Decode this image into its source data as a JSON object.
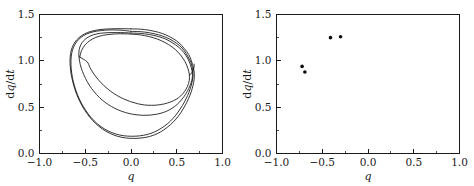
{
  "figure": {
    "background_color": "#ffffff",
    "line_color": "#101010",
    "marker_color": "#0d0d0d",
    "panels": [
      {
        "id": "left",
        "name": "phase-portrait"
      },
      {
        "id": "right",
        "name": "poincare-section"
      }
    ]
  },
  "chart_data": [
    {
      "type": "line",
      "panel": "left",
      "name": "phase-portrait",
      "title": "",
      "xlabel": "q",
      "ylabel": "dq/dt",
      "xlim": [
        -1.0,
        1.0
      ],
      "ylim": [
        0.0,
        1.5
      ],
      "xticks": [
        -1.0,
        -0.5,
        0.0,
        0.5,
        1.0
      ],
      "xtick_labels": [
        "-1.0",
        "-0.5",
        "0.0",
        "0.5",
        "1.0"
      ],
      "yticks": [
        0.0,
        0.5,
        1.0,
        1.5
      ],
      "ytick_labels": [
        "0.0",
        "0.5",
        "1.0",
        "1.5"
      ],
      "x_minor_ticks": [
        -0.75,
        -0.25,
        0.25,
        0.75
      ],
      "y_minor_ticks": [
        0.25,
        0.75,
        1.25
      ],
      "grid": false,
      "legend": null,
      "series": [
        {
          "name": "outer-orbit",
          "comment": "outermost closed loop of the chaotic attractor",
          "points": [
            [
              0.0,
              1.345
            ],
            [
              0.1,
              1.342
            ],
            [
              0.2,
              1.33
            ],
            [
              0.3,
              1.308
            ],
            [
              0.38,
              1.28
            ],
            [
              0.46,
              1.24
            ],
            [
              0.53,
              1.19
            ],
            [
              0.58,
              1.135
            ],
            [
              0.63,
              1.07
            ],
            [
              0.66,
              1.0
            ],
            [
              0.682,
              0.925
            ],
            [
              0.692,
              0.86
            ],
            [
              0.69,
              0.8
            ],
            [
              0.678,
              0.735
            ],
            [
              0.658,
              0.665
            ],
            [
              0.628,
              0.59
            ],
            [
              0.59,
              0.515
            ],
            [
              0.545,
              0.44
            ],
            [
              0.492,
              0.372
            ],
            [
              0.43,
              0.31
            ],
            [
              0.36,
              0.256
            ],
            [
              0.285,
              0.213
            ],
            [
              0.205,
              0.184
            ],
            [
              0.12,
              0.168
            ],
            [
              0.03,
              0.163
            ],
            [
              -0.06,
              0.168
            ],
            [
              -0.148,
              0.186
            ],
            [
              -0.232,
              0.218
            ],
            [
              -0.312,
              0.264
            ],
            [
              -0.386,
              0.323
            ],
            [
              -0.452,
              0.394
            ],
            [
              -0.51,
              0.474
            ],
            [
              -0.56,
              0.562
            ],
            [
              -0.6,
              0.655
            ],
            [
              -0.63,
              0.75
            ],
            [
              -0.652,
              0.845
            ],
            [
              -0.664,
              0.938
            ],
            [
              -0.666,
              1.025
            ],
            [
              -0.655,
              1.105
            ],
            [
              -0.63,
              1.172
            ],
            [
              -0.592,
              1.228
            ],
            [
              -0.54,
              1.272
            ],
            [
              -0.476,
              1.305
            ],
            [
              -0.4,
              1.327
            ],
            [
              -0.316,
              1.34
            ],
            [
              -0.222,
              1.345
            ],
            [
              -0.12,
              1.347
            ],
            [
              0.0,
              1.345
            ]
          ]
        },
        {
          "name": "second-outer-orbit",
          "comment": "loop slightly inside the outer band",
          "points": [
            [
              0.0,
              1.318
            ],
            [
              0.1,
              1.315
            ],
            [
              0.2,
              1.303
            ],
            [
              0.3,
              1.281
            ],
            [
              0.38,
              1.254
            ],
            [
              0.46,
              1.214
            ],
            [
              0.53,
              1.165
            ],
            [
              0.58,
              1.112
            ],
            [
              0.62,
              1.05
            ],
            [
              0.655,
              0.982
            ],
            [
              0.672,
              0.912
            ],
            [
              0.678,
              0.852
            ],
            [
              0.672,
              0.793
            ],
            [
              0.657,
              0.73
            ],
            [
              0.634,
              0.662
            ],
            [
              0.602,
              0.59
            ],
            [
              0.562,
              0.518
            ],
            [
              0.515,
              0.447
            ],
            [
              0.462,
              0.382
            ],
            [
              0.4,
              0.322
            ],
            [
              0.33,
              0.272
            ],
            [
              0.256,
              0.232
            ],
            [
              0.176,
              0.205
            ],
            [
              0.092,
              0.19
            ],
            [
              0.005,
              0.186
            ],
            [
              -0.082,
              0.192
            ],
            [
              -0.168,
              0.211
            ],
            [
              -0.25,
              0.243
            ],
            [
              -0.328,
              0.29
            ],
            [
              -0.4,
              0.35
            ],
            [
              -0.463,
              0.421
            ],
            [
              -0.518,
              0.501
            ],
            [
              -0.565,
              0.588
            ],
            [
              -0.602,
              0.68
            ],
            [
              -0.63,
              0.774
            ],
            [
              -0.648,
              0.868
            ],
            [
              -0.656,
              0.958
            ],
            [
              -0.654,
              1.04
            ],
            [
              -0.64,
              1.115
            ],
            [
              -0.612,
              1.178
            ],
            [
              -0.572,
              1.231
            ],
            [
              -0.518,
              1.272
            ],
            [
              -0.452,
              1.302
            ],
            [
              -0.376,
              1.32
            ],
            [
              -0.292,
              1.33
            ],
            [
              -0.198,
              1.334
            ],
            [
              -0.098,
              1.33
            ],
            [
              0.0,
              1.318
            ]
          ]
        },
        {
          "name": "inner-orbit-a",
          "comment": "inner loop that terminates near the right-hand cusp",
          "points": [
            [
              0.0,
              1.3
            ],
            [
              0.1,
              1.296
            ],
            [
              0.2,
              1.284
            ],
            [
              0.3,
              1.262
            ],
            [
              0.38,
              1.234
            ],
            [
              0.45,
              1.196
            ],
            [
              0.52,
              1.148
            ],
            [
              0.575,
              1.092
            ],
            [
              0.618,
              1.03
            ],
            [
              0.648,
              0.962
            ],
            [
              0.666,
              0.895
            ],
            [
              0.672,
              0.84
            ],
            [
              0.664,
              0.788
            ],
            [
              0.645,
              0.732
            ],
            [
              0.616,
              0.672
            ],
            [
              0.578,
              0.612
            ],
            [
              0.532,
              0.556
            ],
            [
              0.478,
              0.508
            ],
            [
              0.418,
              0.47
            ],
            [
              0.352,
              0.442
            ],
            [
              0.282,
              0.424
            ],
            [
              0.208,
              0.414
            ],
            [
              0.132,
              0.412
            ],
            [
              0.055,
              0.418
            ],
            [
              -0.022,
              0.432
            ],
            [
              -0.1,
              0.455
            ],
            [
              -0.176,
              0.487
            ],
            [
              -0.248,
              0.528
            ],
            [
              -0.316,
              0.578
            ],
            [
              -0.378,
              0.637
            ],
            [
              -0.432,
              0.703
            ],
            [
              -0.478,
              0.774
            ],
            [
              -0.515,
              0.848
            ],
            [
              -0.544,
              0.922
            ],
            [
              -0.562,
              0.996
            ],
            [
              -0.57,
              1.062
            ],
            [
              -0.566,
              1.122
            ],
            [
              -0.548,
              1.175
            ],
            [
              -0.515,
              1.22
            ],
            [
              -0.468,
              1.256
            ],
            [
              -0.408,
              1.282
            ],
            [
              -0.336,
              1.297
            ],
            [
              -0.252,
              1.304
            ],
            [
              -0.16,
              1.305
            ],
            [
              -0.07,
              1.304
            ],
            [
              0.0,
              1.3
            ]
          ]
        },
        {
          "name": "inner-orbit-b",
          "comment": "innermost loop of the lower band",
          "points": [
            [
              -0.56,
              1.04
            ],
            [
              -0.54,
              1.112
            ],
            [
              -0.502,
              1.172
            ],
            [
              -0.45,
              1.218
            ],
            [
              -0.386,
              1.252
            ],
            [
              -0.312,
              1.274
            ],
            [
              -0.228,
              1.286
            ],
            [
              -0.136,
              1.292
            ],
            [
              -0.04,
              1.291
            ],
            [
              0.056,
              1.285
            ],
            [
              0.15,
              1.272
            ],
            [
              0.242,
              1.25
            ],
            [
              0.33,
              1.218
            ],
            [
              0.41,
              1.176
            ],
            [
              0.482,
              1.124
            ],
            [
              0.542,
              1.062
            ],
            [
              0.59,
              0.992
            ],
            [
              0.622,
              0.918
            ],
            [
              0.638,
              0.848
            ],
            [
              0.636,
              0.786
            ],
            [
              0.618,
              0.726
            ],
            [
              0.586,
              0.67
            ],
            [
              0.544,
              0.622
            ],
            [
              0.492,
              0.584
            ],
            [
              0.432,
              0.556
            ],
            [
              0.366,
              0.536
            ],
            [
              0.296,
              0.524
            ],
            [
              0.222,
              0.52
            ],
            [
              0.146,
              0.524
            ],
            [
              0.07,
              0.538
            ],
            [
              -0.006,
              0.56
            ],
            [
              -0.082,
              0.59
            ],
            [
              -0.156,
              0.628
            ],
            [
              -0.228,
              0.675
            ],
            [
              -0.294,
              0.73
            ],
            [
              -0.354,
              0.792
            ],
            [
              -0.406,
              0.858
            ],
            [
              -0.448,
              0.926
            ],
            [
              -0.48,
              0.99
            ],
            [
              -0.56,
              1.04
            ]
          ]
        },
        {
          "name": "right-cusp-connector",
          "comment": "short segment where bands merge on the right edge",
          "points": [
            [
              0.638,
              0.848
            ],
            [
              0.658,
              0.862
            ],
            [
              0.672,
              0.88
            ],
            [
              0.682,
              0.905
            ],
            [
              0.69,
              0.935
            ],
            [
              0.69,
              0.965
            ]
          ]
        }
      ]
    },
    {
      "type": "scatter",
      "panel": "right",
      "name": "poincare-section",
      "title": "",
      "xlabel": "q",
      "ylabel": "dq/dt",
      "xlim": [
        -1.0,
        1.0
      ],
      "ylim": [
        0.0,
        1.5
      ],
      "xticks": [
        -1.0,
        -0.5,
        0.0,
        0.5,
        1.0
      ],
      "xtick_labels": [
        "-1.0",
        "-0.5",
        "0.0",
        "0.5",
        "1.0"
      ],
      "yticks": [
        0.0,
        0.5,
        1.0,
        1.5
      ],
      "ytick_labels": [
        "0.0",
        "0.5",
        "1.0",
        "1.5"
      ],
      "x_minor_ticks": [
        -0.75,
        -0.25,
        0.25,
        0.75
      ],
      "y_minor_ticks": [
        0.25,
        0.75,
        1.25
      ],
      "grid": false,
      "legend": null,
      "marker": "filled-circle",
      "marker_size_px": 3.6,
      "points": [
        {
          "x": -0.41,
          "y": 1.25
        },
        {
          "x": -0.3,
          "y": 1.26
        },
        {
          "x": -0.72,
          "y": 0.94
        },
        {
          "x": -0.69,
          "y": 0.88
        }
      ]
    }
  ]
}
